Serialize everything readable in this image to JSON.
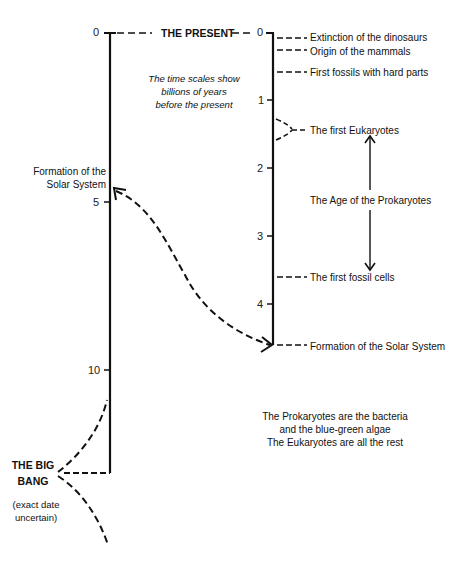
{
  "title": "THE PRESENT",
  "note": {
    "line1": "The time scales show",
    "line2": "billions of years",
    "line3": "before the present"
  },
  "left_scale": {
    "unit": "billions of years before the present",
    "ticks": [
      "0",
      "5",
      "10"
    ],
    "labels": {
      "solar_system_line1": "Formation of the",
      "solar_system_line2": "Solar System",
      "big_bang_line1": "THE BIG",
      "big_bang_line2": "BANG",
      "uncertain_line1": "(exact date",
      "uncertain_line2": "uncertain)"
    }
  },
  "right_scale": {
    "ticks": [
      "0",
      "1",
      "2",
      "3",
      "4"
    ],
    "events": [
      {
        "label": "Extinction of the dinosaurs",
        "age": 0.065
      },
      {
        "label": "Origin of the mammals",
        "age": 0.2
      },
      {
        "label": "First fossils with hard parts",
        "age": 0.57
      },
      {
        "label": "The first Eukaryotes",
        "age": 1.5
      },
      {
        "label": "The first fossil cells",
        "age": 3.5
      },
      {
        "label": "Formation of the Solar System",
        "age": 4.6
      }
    ],
    "span_label": "The Age of the Prokaryotes"
  },
  "footnote": {
    "line1": "The Prokaryotes are the bacteria",
    "line2": "and the blue-green algae",
    "line3": "The Eukaryotes are all the rest"
  }
}
